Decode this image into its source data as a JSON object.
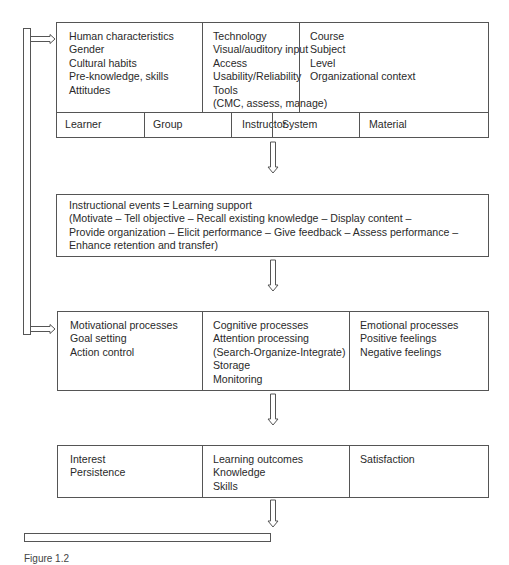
{
  "diagram": {
    "top_box": {
      "columns": [
        {
          "lines": [
            "Human characteristics",
            "Gender",
            "Cultural habits",
            "Pre-knowledge, skills",
            "Attitudes"
          ]
        },
        {
          "lines": [
            "Technology",
            "Visual/auditory input",
            "Access",
            "Usability/Reliability",
            "Tools",
            "(CMC, assess, manage)"
          ]
        },
        {
          "lines": [
            "Course",
            "Subject",
            "Level",
            "Organizational context"
          ]
        }
      ],
      "tabs": [
        "Learner",
        "Group",
        "Instructor",
        "System",
        "Material"
      ]
    },
    "instruction_box": {
      "lines": [
        "Instructional events = Learning support",
        "(Motivate – Tell objective – Recall existing knowledge – Display content –",
        "Provide organization – Elicit performance – Give feedback – Assess performance –",
        "Enhance retention and transfer)"
      ]
    },
    "process_box": {
      "columns": [
        {
          "lines": [
            "Motivational processes",
            "Goal setting",
            "Action control"
          ]
        },
        {
          "lines": [
            "Cognitive processes",
            "Attention processing",
            "(Search-Organize-Integrate)",
            "Storage",
            "Monitoring"
          ]
        },
        {
          "lines": [
            "Emotional processes",
            "Positive feelings",
            "Negative feelings"
          ]
        }
      ]
    },
    "outcome_box": {
      "columns": [
        {
          "lines": [
            "Interest",
            "Persistence"
          ]
        },
        {
          "lines": [
            "Learning outcomes",
            "Knowledge",
            "Skills"
          ]
        },
        {
          "lines": [
            "Satisfaction"
          ]
        }
      ]
    },
    "caption": "Figure 1.2",
    "colors": {
      "stroke": "#555555",
      "text": "#2a2a2a",
      "background": "#ffffff"
    }
  }
}
